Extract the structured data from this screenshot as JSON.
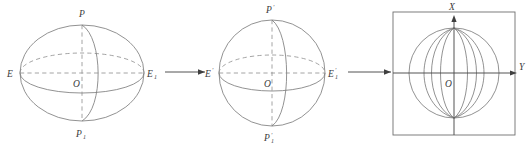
{
  "figure": {
    "panel_count": 3,
    "line_color": "#7e7e7e",
    "dash_color": "#8d8d8d",
    "axis_color": "#4a4a4a",
    "label_color": "#3a3a3a",
    "background": "#ffffff"
  },
  "panels": [
    {
      "id": "ellipsoid",
      "name": "oblate-ellipsoid",
      "shape": "ellipsoid",
      "center_label": "O",
      "labels": {
        "north_pole": "P",
        "south_pole": "P",
        "south_pole_sub": "1",
        "equator_left": "E",
        "equator_right": "E",
        "equator_right_sub": "1",
        "center": "O"
      }
    },
    {
      "id": "sphere",
      "name": "unit-sphere",
      "shape": "sphere",
      "center_label": "O",
      "labels": {
        "north_pole": "P",
        "north_pole_prime": "′",
        "south_pole": "P",
        "south_pole_sub": "1",
        "south_pole_prime": "′",
        "equator_left": "E",
        "equator_left_prime": "′",
        "equator_right": "E",
        "equator_right_sub": "1",
        "equator_right_prime": "′",
        "center": "O"
      }
    },
    {
      "id": "projection",
      "name": "plane-projection",
      "shape": "framed-meridian-sphere",
      "meridian_count": 7,
      "labels": {
        "axis_vertical": "X",
        "axis_horizontal": "Y",
        "origin": "O"
      }
    }
  ],
  "arrows": [
    {
      "name": "arrow-ellipsoid-to-sphere",
      "from": "E1",
      "to": "E-prime"
    },
    {
      "name": "arrow-sphere-to-projection",
      "from": "E1-prime",
      "to": "plane"
    }
  ]
}
